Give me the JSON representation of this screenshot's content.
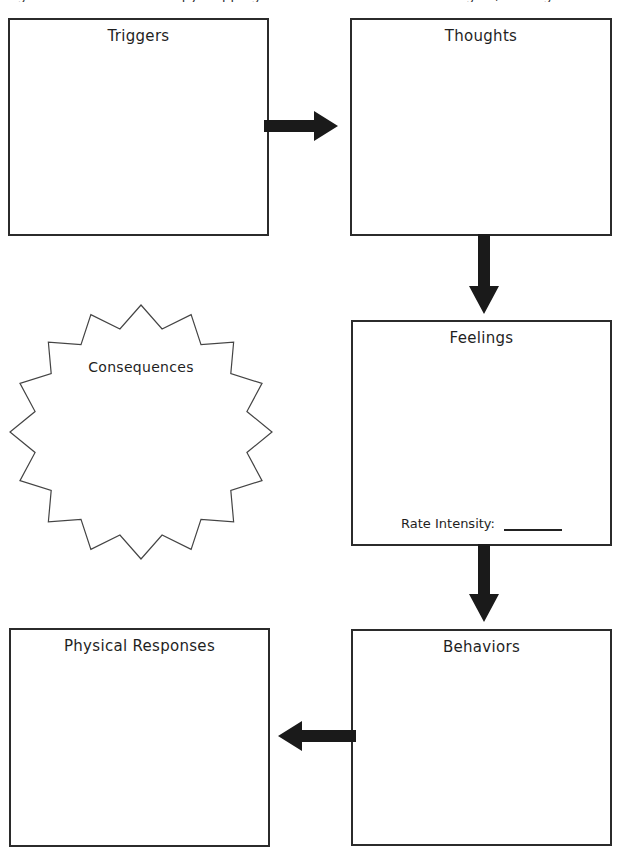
{
  "worksheet": {
    "cut_caption": "Cognitive Behavioral Therapy  Mapping the Connection Between Thoughts, Feelings and Behaviors",
    "background_color": "#ffffff",
    "stroke_color": "#2b2b2b",
    "arrow_color": "#1a1a1a",
    "burst_stroke_color": "#444444"
  },
  "boxes": {
    "triggers": {
      "title": "Triggers"
    },
    "thoughts": {
      "title": "Thoughts"
    },
    "feelings": {
      "title": "Feelings",
      "rate_label": "Rate Intensity:",
      "rate_value": ""
    },
    "physical": {
      "title": "Physical Responses"
    },
    "behaviors": {
      "title": "Behaviors"
    }
  },
  "starburst": {
    "title": "Consequences",
    "points": 16
  },
  "arrows": [
    {
      "name": "triggers-to-thoughts",
      "direction": "right"
    },
    {
      "name": "thoughts-to-feelings",
      "direction": "down"
    },
    {
      "name": "feelings-to-behaviors",
      "direction": "down"
    },
    {
      "name": "behaviors-to-physical",
      "direction": "left"
    }
  ]
}
